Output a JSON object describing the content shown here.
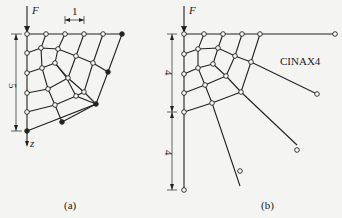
{
  "panel_a": {
    "force_label": "F",
    "top_dim_label": "1",
    "side_dim_label": "5",
    "axis_label": "z",
    "caption": "(a)"
  },
  "panel_b": {
    "force_label": "F",
    "side_dim_upper_label": "4",
    "side_dim_lower_label": "4",
    "element_label": "CINAX4",
    "caption": "(b)"
  },
  "legend": {
    "open_node": "hollow circle node",
    "filled_node": "solid node (boundary)"
  }
}
